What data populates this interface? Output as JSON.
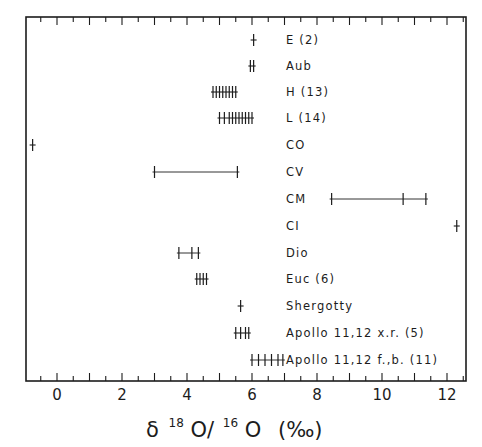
{
  "chart_data": {
    "type": "scatter",
    "title": "",
    "xlabel": "δ18O/16O (‰)",
    "xlabel_parts": {
      "delta": "δ",
      "sup1": "18",
      "o1": "O/",
      "sup2": "16",
      "o2": "O",
      "unit": "(‰)"
    },
    "ylabel": "",
    "xlim": [
      -0.9,
      12.5
    ],
    "xticks": [
      0,
      2,
      4,
      6,
      8,
      10,
      12
    ],
    "minor_tick_step": 0.5,
    "grid": false,
    "legend": "none",
    "line_color": "#1c1c1c",
    "series": [
      {
        "name": "E (2)",
        "values": [
          6.05
        ],
        "range_line": false
      },
      {
        "name": "Aub",
        "values": [
          5.95,
          6.05
        ],
        "range_line": false
      },
      {
        "name": "H (13)",
        "values": [
          4.8,
          4.9,
          5.0,
          5.1,
          5.2,
          5.3,
          5.4,
          5.5
        ],
        "range_line": false
      },
      {
        "name": "L (14)",
        "values": [
          5.0,
          5.15,
          5.3,
          5.4,
          5.5,
          5.6,
          5.7,
          5.8,
          5.9,
          6.0
        ],
        "range_line": false
      },
      {
        "name": "CO",
        "values": [
          -0.75
        ],
        "range_line": false
      },
      {
        "name": "CV",
        "values": [
          3.0,
          5.55
        ],
        "range_line": true
      },
      {
        "name": "CM",
        "values": [
          8.45,
          10.65,
          11.35
        ],
        "range_line": true
      },
      {
        "name": "CI",
        "values": [
          12.3
        ],
        "range_line": false
      },
      {
        "name": "Dio",
        "values": [
          3.75,
          4.15,
          4.35
        ],
        "range_line": true
      },
      {
        "name": "Euc (6)",
        "values": [
          4.3,
          4.4,
          4.5,
          4.6
        ],
        "range_line": false
      },
      {
        "name": "Shergotty",
        "values": [
          5.65
        ],
        "range_line": false
      },
      {
        "name": "Apollo 11,12  x.r. (5)",
        "values": [
          5.5,
          5.65,
          5.8,
          5.9
        ],
        "range_line": false
      },
      {
        "name": "Apollo 11,12  f.,b. (11)",
        "values": [
          6.0,
          6.2,
          6.4,
          6.6,
          6.8,
          6.95
        ],
        "range_line": true
      }
    ]
  }
}
